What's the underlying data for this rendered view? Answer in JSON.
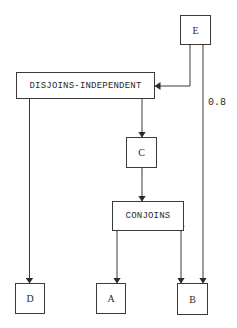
{
  "diagram": {
    "nodes": {
      "E": {
        "label": "E"
      },
      "disjoins": {
        "label": "DISJOINS-INDEPENDENT"
      },
      "C": {
        "label": "C"
      },
      "conjoins": {
        "label": "CONJOINS"
      },
      "D": {
        "label": "D"
      },
      "A": {
        "label": "A"
      },
      "B": {
        "label": "B"
      }
    },
    "edges": [
      {
        "from": "E",
        "to": "DISJOINS-INDEPENDENT",
        "direction": "both"
      },
      {
        "from": "E",
        "to": "B",
        "direction": "both",
        "label": "0.8"
      },
      {
        "from": "DISJOINS-INDEPENDENT",
        "to": "D",
        "direction": "both"
      },
      {
        "from": "DISJOINS-INDEPENDENT",
        "to": "C",
        "direction": "both"
      },
      {
        "from": "C",
        "to": "CONJOINS",
        "direction": "both"
      },
      {
        "from": "CONJOINS",
        "to": "A",
        "direction": "both"
      },
      {
        "from": "CONJOINS",
        "to": "B",
        "direction": "both"
      }
    ],
    "edge_label": "0.8",
    "line_color": "#3a3a3a"
  }
}
